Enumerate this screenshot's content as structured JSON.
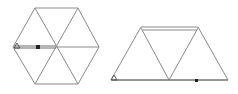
{
  "diagram": {
    "figures": [
      {
        "name": "hexagon",
        "description": "Regular hexagon subdivided into 6 equilateral triangles",
        "vertices": [
          [
            35,
            8
          ],
          [
            78,
            8
          ],
          [
            99,
            47
          ],
          [
            78,
            84
          ],
          [
            35,
            84
          ],
          [
            13,
            47
          ]
        ],
        "center": [
          56,
          47
        ],
        "path": {
          "from": [
            13,
            47
          ],
          "to": [
            56,
            47
          ],
          "marker_at": [
            38,
            47
          ]
        },
        "start_marker": [
          14,
          47
        ]
      },
      {
        "name": "trapezoid",
        "description": "Trapezoid made of 3 equilateral triangles",
        "vertices": [
          [
            111,
            80
          ],
          [
            141,
            28
          ],
          [
            198,
            28
          ],
          [
            228,
            80
          ]
        ],
        "inner_vertex": [
          169,
          80
        ],
        "top_double_line_offset": 3,
        "path": {
          "from": [
            111,
            80
          ],
          "to": [
            228,
            80
          ],
          "marker_at": [
            196,
            80
          ]
        },
        "start_marker": [
          112,
          79
        ]
      }
    ],
    "colors": {
      "edge": "#8a8a8a",
      "path": "#6a6a6a",
      "marker": "#222222"
    }
  }
}
